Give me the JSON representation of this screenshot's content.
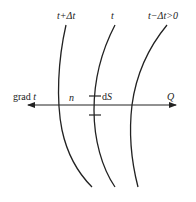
{
  "labels": {
    "iso_plus": "t+Δt",
    "iso_mid": "t",
    "iso_minus": "t−Δt>0",
    "grad_prefix": "grad ",
    "grad_var": "t",
    "normal": "n",
    "area_d": "d",
    "area_S": "S",
    "heat_flow": "Q"
  },
  "colors": {
    "stroke": "#222222",
    "background": "#ffffff"
  }
}
